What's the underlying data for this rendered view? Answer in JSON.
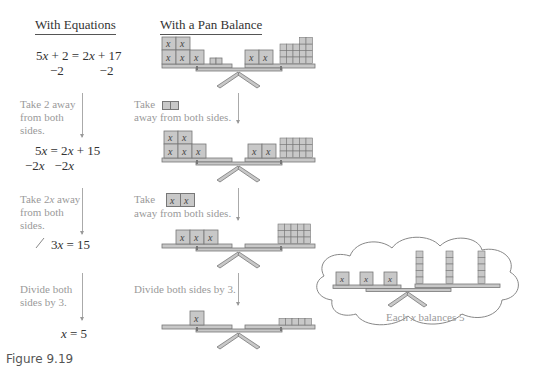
{
  "headers": {
    "equations": "With Equations",
    "balance": "With a Pan Balance"
  },
  "steps": [
    {
      "equation": "5x + 2 = 2x + 17",
      "operation": "−2          −2",
      "left": {
        "x": 5,
        "units": 2
      },
      "right": {
        "x": 2,
        "units": 17
      }
    },
    {
      "note_equation": [
        "Take 2 away",
        "from both",
        "sides."
      ],
      "note_balance_1": "Take",
      "note_balance_2": "away from both sides.",
      "equation": "5x = 2x + 15",
      "operation": "−2x   −2x",
      "left": {
        "x": 5,
        "units": 0
      },
      "right": {
        "x": 2,
        "units": 15
      }
    },
    {
      "note_equation": [
        "Take 2x away",
        "from both",
        "sides."
      ],
      "note_balance_1": "Take",
      "note_balance_2": "away from both sides.",
      "equation": "3x = 15",
      "left": {
        "x": 3,
        "units": 0
      },
      "right": {
        "x": 0,
        "units": 15
      }
    },
    {
      "note_equation": [
        "Divide both",
        "sides by 3."
      ],
      "note_balance": "Divide both sides by 3.",
      "equation": "x = 5",
      "left": {
        "x": 1,
        "units": 0
      },
      "right": {
        "x": 0,
        "units": 5
      }
    }
  ],
  "cloud": {
    "caption": "Each x balances 5",
    "left_x": 3,
    "right_columns": 3,
    "units_per_column": 5
  },
  "figure_label": "Figure 9.19",
  "colors": {
    "block_fill": "#c8c8c8",
    "block_stroke": "#777777",
    "note_text": "#9a9a9a"
  }
}
